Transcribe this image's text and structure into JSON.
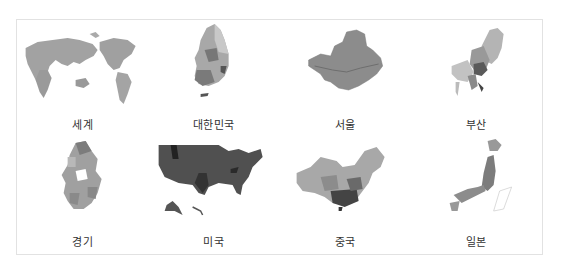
{
  "maps": [
    {
      "id": "world",
      "label": "세계",
      "color": "#9c9c9c"
    },
    {
      "id": "korea",
      "label": "대한민국",
      "color": "#8e8e8e"
    },
    {
      "id": "seoul",
      "label": "서울",
      "color": "#8a8a8a"
    },
    {
      "id": "busan",
      "label": "부산",
      "color": "#a0a0a0"
    },
    {
      "id": "gyeonggi",
      "label": "경기",
      "color": "#9a9a9a"
    },
    {
      "id": "usa",
      "label": "미국",
      "color": "#555555"
    },
    {
      "id": "china",
      "label": "중국",
      "color": "#9e9e9e"
    },
    {
      "id": "japan",
      "label": "일본",
      "color": "#8c8c8c"
    }
  ]
}
